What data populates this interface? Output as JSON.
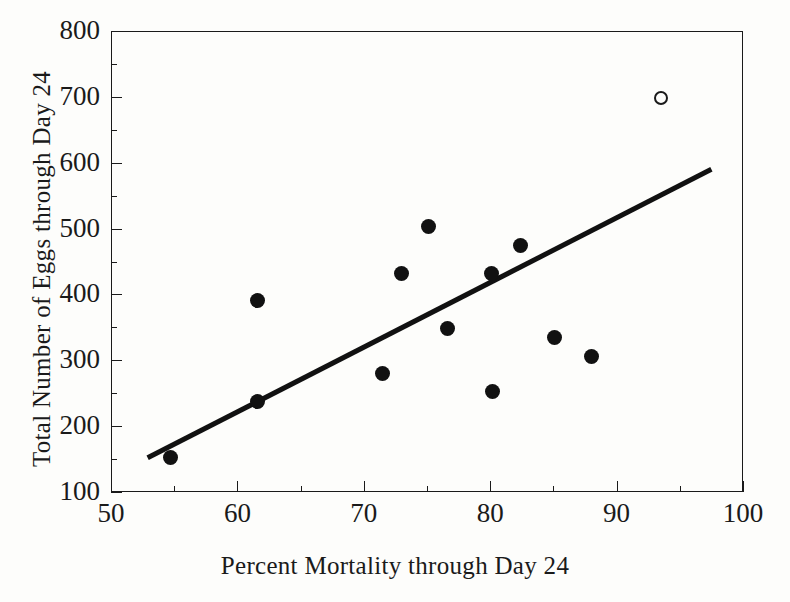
{
  "figure": {
    "background_color": "#fdfdfb",
    "ink_color": "#1a1a1a"
  },
  "chart_data": {
    "type": "scatter",
    "title": "",
    "xlabel": "Percent Mortality through Day 24",
    "ylabel": "Total Number of Eggs through Day 24",
    "xlim": [
      50,
      100
    ],
    "ylim": [
      100,
      800
    ],
    "xticks": [
      50,
      60,
      70,
      80,
      90,
      100
    ],
    "xtick_labels": [
      "50",
      "60",
      "70",
      "80",
      "90",
      "100"
    ],
    "xminor_step": 5,
    "yticks": [
      100,
      200,
      300,
      400,
      500,
      600,
      700,
      800
    ],
    "ytick_labels": [
      "100",
      "200",
      "300",
      "400",
      "500",
      "600",
      "700",
      "800"
    ],
    "yminor_step": 50,
    "grid": false,
    "legend": false,
    "legend_position": "none",
    "series": [
      {
        "name": "filled-points",
        "marker": "filled-circle",
        "color": "#111111",
        "points": [
          {
            "x": 54.7,
            "y": 153
          },
          {
            "x": 61.6,
            "y": 238
          },
          {
            "x": 61.6,
            "y": 391
          },
          {
            "x": 71.5,
            "y": 280
          },
          {
            "x": 73.0,
            "y": 432
          },
          {
            "x": 75.1,
            "y": 503
          },
          {
            "x": 76.6,
            "y": 348
          },
          {
            "x": 80.1,
            "y": 432
          },
          {
            "x": 80.2,
            "y": 252
          },
          {
            "x": 82.4,
            "y": 475
          },
          {
            "x": 85.1,
            "y": 334
          },
          {
            "x": 88.0,
            "y": 306
          }
        ]
      },
      {
        "name": "open-point-outlier",
        "marker": "open-circle",
        "color": "#1a1a1a",
        "points": [
          {
            "x": 93.5,
            "y": 698
          }
        ]
      }
    ],
    "fit_line": {
      "name": "regression-line",
      "color": "#111111",
      "width_px": 5,
      "x_start": 52.9,
      "y_start": 152,
      "x_end": 97.5,
      "y_end": 590
    }
  }
}
